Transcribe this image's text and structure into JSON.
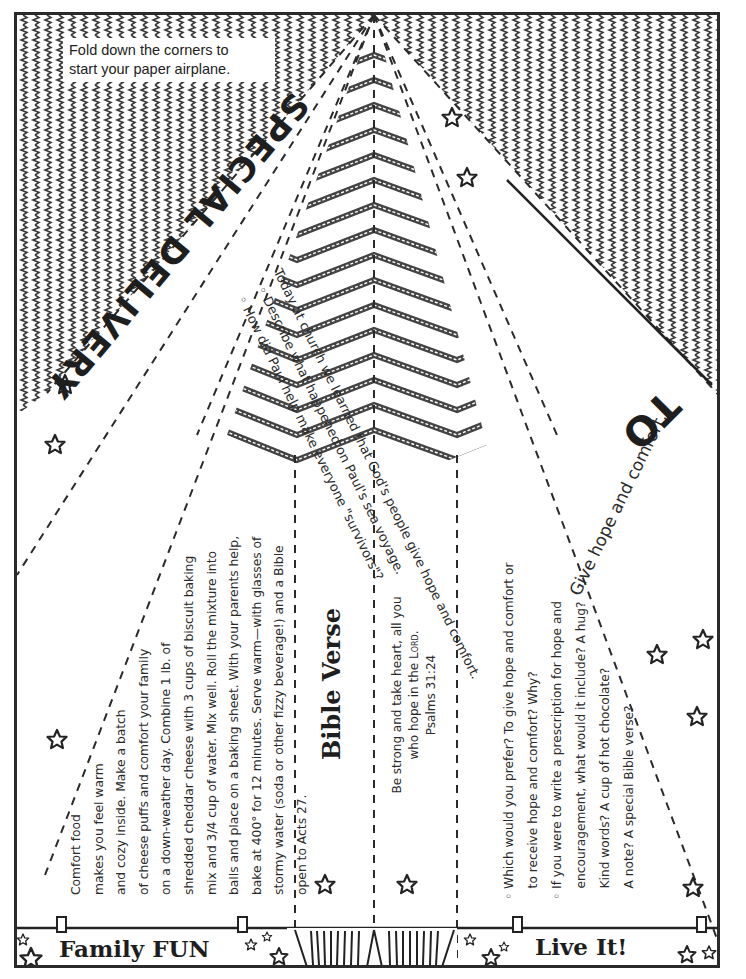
{
  "page": {
    "fold_instructions": [
      "Fold down the corners to",
      "start your paper airplane."
    ],
    "title": "SPECIAL DELIVERY",
    "to_label": "TO",
    "give_line": "Give hope and comfort."
  },
  "church_section": {
    "intro": "Today at church we learned that God's people give hope and comfort.",
    "bullets": [
      "Describe what happened on Paul's sea voyage.",
      "How did Paul help make everyone \"survivors\"?"
    ]
  },
  "family_fun": {
    "label": "Family FUN",
    "lines": [
      "Comfort food",
      "makes you feel warm",
      "and cozy inside.  Make a batch",
      "of cheese puffs and comfort your family",
      "on a down-weather day. Combine 1 lb. of",
      "shredded cheddar cheese with 3 cups of biscuit baking",
      "mix and 3/4 cup of water. Mix well. Roll the mixture into",
      "balls and place on a baking sheet. With your parents help,",
      "bake at 400° for 12 minutes. Serve warm—with glasses of",
      "stormy water (soda or other fizzy beverage!) and a Bible",
      "open to Acts 27."
    ]
  },
  "bible_verse": {
    "label": "Bible Verse",
    "lines": [
      "Be strong and take heart, all you",
      "who hope in the"
    ],
    "lord": "Lord.",
    "reference": "Psalms 31:24"
  },
  "live_it": {
    "label": "Live It!",
    "bullet_marker": "◦",
    "lines": [
      {
        "bullet": true,
        "text": "Which would you prefer? To give hope and comfort or"
      },
      {
        "bullet": false,
        "text": "to receive hope and comfort?  Why?"
      },
      {
        "bullet": true,
        "text": "If you were to write a prescription for hope and"
      },
      {
        "bullet": false,
        "text": "encouragement, what would it include? A hug?"
      },
      {
        "bullet": false,
        "text": "Kind words? A cup of hot chocolate?"
      },
      {
        "bullet": false,
        "text": "A note? A special Bible verse?"
      }
    ]
  },
  "icons": {
    "star": "star-outline-icon",
    "zigzag": "zigzag-pattern",
    "chevron": "chevron-stripe-pattern"
  },
  "colors": {
    "ink": "#2a2a2a",
    "paper": "#ffffff"
  }
}
